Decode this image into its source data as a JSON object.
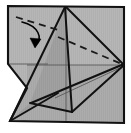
{
  "figure": {
    "title": "Origami fold step diagram",
    "type": "origami-diagram",
    "caption": "",
    "canvas": {
      "width": 131,
      "height": 133
    },
    "colors": {
      "paper_fill": "#a6a6a6",
      "paper_fill_light": "#b2b2b2",
      "paper_fill_dark": "#9a9a9a",
      "outline": "#111111",
      "crease_line": "#5a5a5a",
      "fold_line_dashed": "#1a1a1a",
      "arrow": "#000000",
      "background": "#ffffff"
    },
    "stroke_widths": {
      "outline": 2.1,
      "edge": 2.0,
      "crease": 0.9,
      "dashed": 1.8,
      "arrow": 1.6
    },
    "shapes": {
      "paper_silhouette": "M 8,6 L 124,7 L 124,123 L 10,121 L 27,88 L 8,64 Z",
      "main_body": "M 8,6 L 124,7 L 124,123 L 10,121 L 27,88 L 8,64 Z",
      "right_panel": "M 66,7 L 124,7 L 124,65 Z",
      "lower_right_panel": "M 66,65 L 124,65 L 124,123 L 66,123 Z",
      "center_flap": "M 65,7 L 30,103 L 10,121 L 55,100 Z",
      "center_flap_fold": "M 65,7 L 72,112 L 30,103 Z",
      "left_notch": "M 8,64 L 27,88 L 10,121 Z"
    },
    "edges": [
      {
        "name": "top-edge",
        "from": [
          8,
          6
        ],
        "to": [
          124,
          7
        ]
      },
      {
        "name": "right-edge",
        "from": [
          124,
          7
        ],
        "to": [
          124,
          123
        ]
      },
      {
        "name": "bottom-edge",
        "from": [
          10,
          121
        ],
        "to": [
          124,
          123
        ]
      },
      {
        "name": "left-upper-edge",
        "from": [
          8,
          6
        ],
        "to": [
          8,
          64
        ]
      },
      {
        "name": "left-notch-upper",
        "from": [
          8,
          64
        ],
        "to": [
          27,
          88
        ]
      },
      {
        "name": "left-notch-lower",
        "from": [
          27,
          88
        ],
        "to": [
          10,
          121
        ]
      }
    ],
    "fold_edges": [
      {
        "name": "apex-to-bottom-left",
        "from": [
          65,
          7
        ],
        "to": [
          10,
          121
        ]
      },
      {
        "name": "apex-to-flap-spine",
        "from": [
          65,
          7
        ],
        "to": [
          72,
          112
        ]
      },
      {
        "name": "apex-to-right-corner",
        "from": [
          66,
          7
        ],
        "to": [
          124,
          65
        ]
      },
      {
        "name": "flap-lower-left-diagonal",
        "from": [
          10,
          121
        ],
        "to": [
          58,
          93
        ]
      },
      {
        "name": "flap-inner-diagonal",
        "from": [
          30,
          103
        ],
        "to": [
          72,
          112
        ]
      },
      {
        "name": "right-lower-diagonal",
        "from": [
          124,
          65
        ],
        "to": [
          72,
          112
        ]
      },
      {
        "name": "right-lower-x",
        "from": [
          30,
          103
        ],
        "to": [
          124,
          65
        ]
      }
    ],
    "crease_lines": [
      {
        "name": "horizontal-center-crease",
        "from": [
          27,
          65
        ],
        "to": [
          124,
          65
        ]
      },
      {
        "name": "vertical-center-crease",
        "from": [
          66,
          7
        ],
        "to": [
          66,
          123
        ]
      },
      {
        "name": "lower-right-faint-diagonal",
        "from": [
          55,
          98
        ],
        "to": [
          124,
          66
        ]
      },
      {
        "name": "upper-left-faint-crease",
        "from": [
          8,
          64
        ],
        "to": [
          48,
          64
        ]
      }
    ],
    "dashed_fold_lines": [
      {
        "name": "upper-left-valley-fold",
        "from": [
          16,
          17
        ],
        "to": [
          58,
          30
        ],
        "dash": "7 5"
      },
      {
        "name": "upper-right-valley-fold",
        "from": [
          58,
          37
        ],
        "to": [
          124,
          65
        ],
        "dash": "7 5"
      }
    ],
    "arrow": {
      "name": "fold-direction-arrow",
      "path": "M 22,22 C 38,26 44,38 35,46",
      "head": "M 35,48 L 30,38 L 41,39 Z",
      "direction": "down",
      "label": ""
    }
  }
}
